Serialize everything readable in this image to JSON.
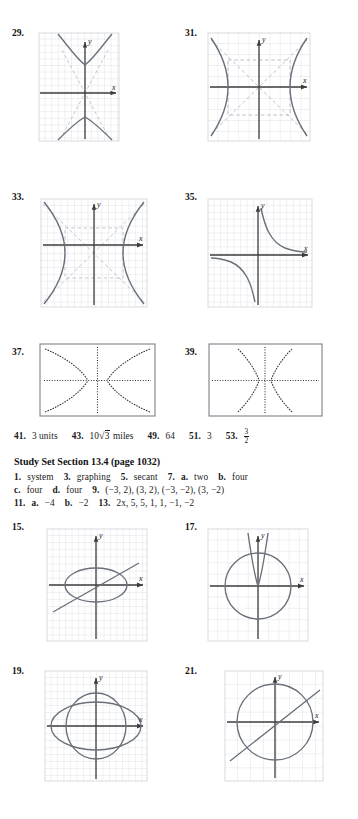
{
  "page": {
    "kind": "textbook-answer-key",
    "background": "#ffffff",
    "ink": "#1a1a1a",
    "grid_color": "#c9cdd6",
    "curve_color": "#5a5f6b",
    "axis_color": "#3a3a3a",
    "dash_color": "#aab0ba"
  },
  "problems": [
    {
      "id": "29",
      "label": "29.",
      "type": "graph-grid",
      "figure": "vertical-hyperbola-with-asymptotes",
      "x_axis_label": "x",
      "y_axis_label": "y"
    },
    {
      "id": "31",
      "label": "31.",
      "type": "graph-grid",
      "figure": "horizontal-hyperbola-with-asymptotes-and-box",
      "x_axis_label": "x",
      "y_axis_label": "y"
    },
    {
      "id": "33",
      "label": "33.",
      "type": "graph-grid",
      "figure": "horizontal-hyperbola-with-asymptotes-and-box",
      "x_axis_label": "x",
      "y_axis_label": "y"
    },
    {
      "id": "35",
      "label": "35.",
      "type": "graph-grid",
      "figure": "rectangular-hyperbola-xy-equals-k",
      "x_axis_label": "x",
      "y_axis_label": "y"
    },
    {
      "id": "37",
      "label": "37.",
      "type": "calculator-screen",
      "figure": "horizontal-hyperbola-dotted-axes"
    },
    {
      "id": "39",
      "label": "39.",
      "type": "calculator-screen",
      "figure": "vertical-hyperbola-dotted-axes"
    },
    {
      "id": "15",
      "label": "15.",
      "type": "graph-grid",
      "figure": "ellipse-and-line",
      "x_axis_label": "x",
      "y_axis_label": "y"
    },
    {
      "id": "17",
      "label": "17.",
      "type": "graph-grid",
      "figure": "circle-and-narrow-parabola",
      "x_axis_label": "x",
      "y_axis_label": "y"
    },
    {
      "id": "19",
      "label": "19.",
      "type": "graph-grid",
      "figure": "two-overlapping-ellipses",
      "x_axis_label": "x",
      "y_axis_label": "y"
    },
    {
      "id": "21",
      "label": "21.",
      "type": "graph-grid",
      "figure": "circle-and-line",
      "x_axis_label": "x",
      "y_axis_label": "y"
    }
  ],
  "answers_row_41": {
    "n41": "41.",
    "a41": "3 units",
    "n43": "43.",
    "a43_coef": "10",
    "a43_radicand": "3",
    "a43_unit": "miles",
    "n49": "49.",
    "a49": "64",
    "n51": "51.",
    "a51": "3",
    "n53": "53.",
    "a53_num": "3",
    "a53_den": "2"
  },
  "study_set": {
    "heading": "Study Set Section 13.4 (page 1032)",
    "lines": [
      {
        "items": [
          {
            "num": "1.",
            "ans": "system"
          },
          {
            "num": "3.",
            "ans": "graphing"
          },
          {
            "num": "5.",
            "ans": "secant"
          },
          {
            "num": "7.",
            "ans": "",
            "parts": [
              {
                "letter": "a.",
                "value": "two"
              },
              {
                "letter": "b.",
                "value": "four"
              }
            ]
          }
        ]
      },
      {
        "items": [
          {
            "num": "",
            "ans": "",
            "parts": [
              {
                "letter": "c.",
                "value": "four"
              },
              {
                "letter": "d.",
                "value": "four"
              }
            ]
          },
          {
            "num": "9.",
            "ans": "(−3, 2), (3, 2), (−3, −2), (3, −2)"
          }
        ]
      },
      {
        "items": [
          {
            "num": "11.",
            "ans": "",
            "parts": [
              {
                "letter": "a.",
                "value": "−4"
              },
              {
                "letter": "b.",
                "value": "−2"
              }
            ]
          },
          {
            "num": "13.",
            "ans": "2x, 5, 5, 1, 1, −1, −2"
          }
        ]
      }
    ],
    "flat": {
      "n1": "1.",
      "a1": "system",
      "n3": "3.",
      "a3": "graphing",
      "n5": "5.",
      "a5": "secant",
      "n7": "7.",
      "l7a": "a.",
      "v7a": "two",
      "l7b": "b.",
      "v7b": "four",
      "l9c": "c.",
      "v9c": "four",
      "l9d": "d.",
      "v9d": "four",
      "n9": "9.",
      "a9": "(−3, 2), (3, 2), (−3, −2), (3, −2)",
      "n11": "11.",
      "l11a": "a.",
      "v11a": "−4",
      "l11b": "b.",
      "v11b": "−2",
      "n13": "13.",
      "a13": "2x, 5, 5, 1, 1, −1, −2"
    }
  }
}
